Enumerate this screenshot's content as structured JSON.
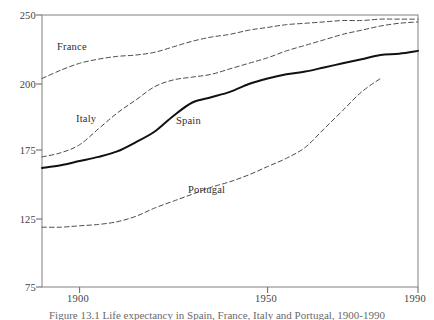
{
  "figure": {
    "caption_partial": "Figure 13.1  Life expectancy in Spain, France, Italy and Portugal, 1900-1990"
  },
  "chart_data": {
    "type": "line",
    "title": "",
    "xlabel": "",
    "ylabel": "",
    "xlim": [
      1890,
      1990
    ],
    "ylim": [
      75,
      250
    ],
    "grid": false,
    "legend": "inline-labels",
    "x_ticks": [
      1900,
      1950,
      1990
    ],
    "x_tick_labels": [
      "1900",
      "1950",
      "1990"
    ],
    "y_ticks": [
      75,
      125,
      175,
      200,
      250
    ],
    "y_tick_labels": [
      "75",
      "125",
      "175",
      "200",
      "250"
    ],
    "y_axis_note": "non-linear tick spacing; ticks placed at equal-ish pixel intervals",
    "series": [
      {
        "name": "France",
        "style": "dashed",
        "color": "#4a4a4a",
        "label_position": {
          "x": 57,
          "y": 41
        },
        "x": [
          1890,
          1895,
          1900,
          1905,
          1910,
          1915,
          1920,
          1925,
          1930,
          1935,
          1940,
          1945,
          1950,
          1955,
          1960,
          1965,
          1970,
          1975,
          1980,
          1985,
          1990
        ],
        "values": [
          204,
          210,
          215,
          218,
          220,
          221,
          223,
          227,
          231,
          234,
          236,
          239,
          241,
          243,
          244,
          245,
          246,
          246,
          247,
          247,
          247
        ]
      },
      {
        "name": "Italy",
        "style": "dashed",
        "color": "#4a4a4a",
        "label_position": {
          "x": 76,
          "y": 113
        },
        "x": [
          1890,
          1895,
          1900,
          1905,
          1910,
          1915,
          1920,
          1925,
          1930,
          1935,
          1940,
          1945,
          1950,
          1955,
          1960,
          1965,
          1970,
          1975,
          1980,
          1985,
          1990
        ],
        "values": [
          170,
          173,
          177,
          183,
          189,
          194,
          199,
          203,
          205,
          207,
          211,
          215,
          219,
          224,
          228,
          232,
          236,
          239,
          242,
          244,
          245
        ]
      },
      {
        "name": "Spain",
        "style": "solid",
        "color": "#111111",
        "label_position": {
          "x": 176,
          "y": 115
        },
        "x": [
          1890,
          1895,
          1900,
          1905,
          1910,
          1915,
          1920,
          1925,
          1930,
          1935,
          1940,
          1945,
          1950,
          1955,
          1960,
          1965,
          1970,
          1975,
          1980,
          1985,
          1990
        ],
        "values": [
          162,
          164,
          167,
          170,
          174,
          178,
          182,
          188,
          193,
          195,
          197,
          200,
          204,
          207,
          209,
          212,
          215,
          218,
          221,
          222,
          224
        ]
      },
      {
        "name": "Portugal",
        "style": "dashed",
        "color": "#4a4a4a",
        "label_position": {
          "x": 188,
          "y": 184
        },
        "x": [
          1890,
          1895,
          1900,
          1905,
          1910,
          1915,
          1920,
          1925,
          1930,
          1935,
          1940,
          1945,
          1950,
          1955,
          1960,
          1965,
          1970,
          1975,
          1980
        ],
        "values": [
          119,
          119,
          120,
          121,
          123,
          127,
          133,
          138,
          143,
          148,
          152,
          157,
          163,
          169,
          176,
          183,
          190,
          197,
          204
        ]
      }
    ]
  }
}
